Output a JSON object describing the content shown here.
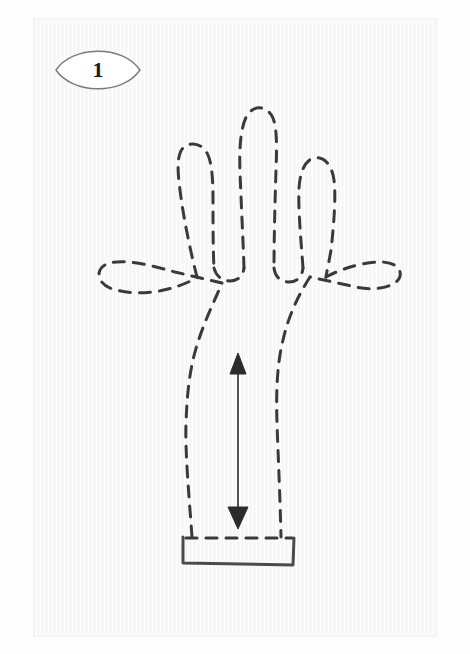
{
  "figure": {
    "domain_label": "instructional-sewing-diagram",
    "title": "Glove pattern step diagram",
    "step_number": "1",
    "panel": {
      "background_color": "#fbfbfb",
      "border_color": "#f2f2f2",
      "x": 33,
      "y": 18,
      "width": 404,
      "height": 619
    },
    "colors": {
      "paper": "#fbfbfb",
      "outer_margin": "#fdfdfd",
      "ink_dashed": "#3a3a3a",
      "ink_solid": "#4a4a4a",
      "badge_outline": "#7a7a7a",
      "badge_fill": "#ffffff",
      "arrow": "#2b2b2b",
      "text": "#1a1a1a"
    }
  },
  "step_badge": {
    "shape": "lens",
    "number": "1",
    "x": 55,
    "y": 45,
    "width": 86,
    "height": 50
  },
  "hand_outline": {
    "name": "glove-hand-dashed-outline",
    "line_style": "dashed",
    "stroke_width": 3,
    "dash_pattern": "11 9",
    "digits": [
      {
        "name": "thumb",
        "tip_x": 104,
        "tip_y": 264
      },
      {
        "name": "index-finger",
        "tip_x": 185,
        "tip_y": 145
      },
      {
        "name": "middle-finger",
        "tip_x": 256,
        "tip_y": 107
      },
      {
        "name": "ring-finger",
        "tip_x": 318,
        "tip_y": 158
      },
      {
        "name": "pinky-finger",
        "tip_x": 380,
        "tip_y": 253
      }
    ]
  },
  "cuff": {
    "name": "glove-cuff-rectangle",
    "line_style": "solid",
    "x": 183,
    "y": 537,
    "width": 110,
    "height": 27
  },
  "measurement_arrow": {
    "name": "palm-height-double-arrow",
    "orientation": "vertical",
    "double_headed": true,
    "x": 238,
    "top_y": 355,
    "bottom_y": 527,
    "length_px": 172,
    "label": ""
  }
}
